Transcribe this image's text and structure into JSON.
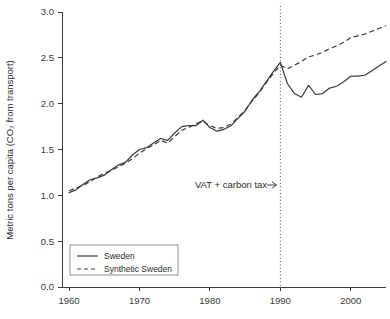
{
  "chart_data": {
    "type": "line",
    "title": "",
    "subtitle": "",
    "xlabel": "",
    "ylabel": "Metric tons per capita (CO₂ from transport)",
    "xlim": [
      1959,
      2005
    ],
    "ylim": [
      0.0,
      3.0
    ],
    "grid": false,
    "legend_position": "lower-left-inside",
    "x_ticks": [
      1960,
      1970,
      1980,
      1990,
      2000
    ],
    "x_tick_labels": [
      "1960",
      "1970",
      "1980",
      "1990",
      "2000"
    ],
    "y_ticks": [
      0.0,
      0.5,
      1.0,
      1.5,
      2.0,
      2.5,
      3.0
    ],
    "y_tick_labels": [
      "0.0",
      "0.5",
      "1.0",
      "1.5",
      "2.0",
      "2.5",
      "3.0"
    ],
    "annotations": [
      {
        "name": "treatment-marker",
        "text": "VAT + carbon tax",
        "arrow": "→",
        "x": 1990,
        "style": "dotted-vertical-line",
        "label_x": 1983.0,
        "label_y": 1.08
      }
    ],
    "x": [
      1960,
      1961,
      1962,
      1963,
      1964,
      1965,
      1966,
      1967,
      1968,
      1969,
      1970,
      1971,
      1972,
      1973,
      1974,
      1975,
      1976,
      1977,
      1978,
      1979,
      1980,
      1981,
      1982,
      1983,
      1984,
      1985,
      1986,
      1987,
      1988,
      1989,
      1990,
      1991,
      1992,
      1993,
      1994,
      1995,
      1996,
      1997,
      1998,
      1999,
      2000,
      2001,
      2002,
      2003,
      2004,
      2005
    ],
    "series": [
      {
        "name": "Sweden",
        "style": "solid",
        "color": "#3a3a3a",
        "values": [
          1.03,
          1.06,
          1.12,
          1.17,
          1.19,
          1.22,
          1.28,
          1.33,
          1.36,
          1.44,
          1.5,
          1.52,
          1.57,
          1.62,
          1.6,
          1.68,
          1.75,
          1.76,
          1.76,
          1.82,
          1.74,
          1.7,
          1.72,
          1.76,
          1.84,
          1.92,
          2.04,
          2.13,
          2.24,
          2.35,
          2.45,
          2.22,
          2.11,
          2.07,
          2.2,
          2.1,
          2.11,
          2.17,
          2.19,
          2.24,
          2.3,
          2.3,
          2.31,
          2.36,
          2.41,
          2.46
        ]
      },
      {
        "name": "Synthetic Sweden",
        "style": "dashed",
        "color": "#3a3a3a",
        "values": [
          1.05,
          1.08,
          1.11,
          1.15,
          1.2,
          1.24,
          1.27,
          1.31,
          1.35,
          1.4,
          1.46,
          1.51,
          1.55,
          1.6,
          1.57,
          1.64,
          1.71,
          1.74,
          1.78,
          1.81,
          1.76,
          1.73,
          1.74,
          1.78,
          1.85,
          1.93,
          2.03,
          2.12,
          2.23,
          2.33,
          2.42,
          2.38,
          2.42,
          2.46,
          2.51,
          2.53,
          2.56,
          2.6,
          2.63,
          2.67,
          2.72,
          2.74,
          2.76,
          2.79,
          2.82,
          2.85
        ]
      }
    ],
    "legend_entries": [
      {
        "label": "Sweden",
        "style": "solid"
      },
      {
        "label": "Synthetic Sweden",
        "style": "dashed"
      }
    ]
  }
}
